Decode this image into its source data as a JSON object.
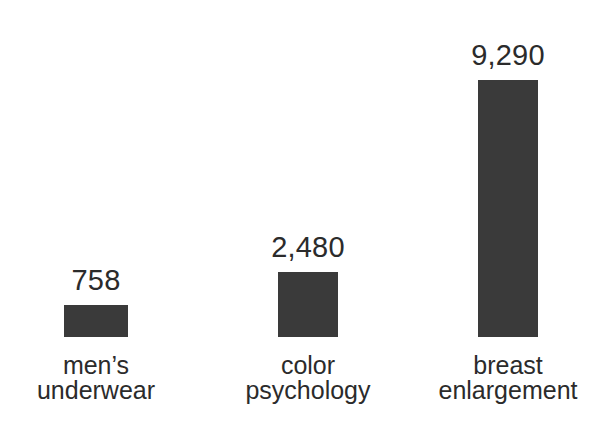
{
  "chart_data": {
    "type": "bar",
    "title": "",
    "subtitle": "",
    "xlabel": "",
    "ylabel": "",
    "grid": false,
    "legend": false,
    "legend_position": "none",
    "orientation": "vertical",
    "background_color": "#ffffff",
    "bar_color": "#3a3a3a",
    "text_color": "#2b2b2b",
    "baseline_visible": false,
    "axis_visible": false,
    "ylim": [
      0,
      9290
    ],
    "categories": [
      "men’s underwear",
      "color psychology",
      "breast enlargement"
    ],
    "category_lines": [
      [
        "men’s",
        "underwear"
      ],
      [
        "color",
        "psychology"
      ],
      [
        "breast",
        "enlargement"
      ]
    ],
    "values": [
      758,
      2480,
      9290
    ],
    "value_labels": [
      "758",
      "2,480",
      "9,290"
    ],
    "bars": [
      {
        "category": "men’s underwear",
        "line1": "men’s",
        "line2": "underwear",
        "value": 758,
        "value_label": "758",
        "left_px": 64,
        "width_px": 64,
        "height_px": 32,
        "center_px": 96
      },
      {
        "category": "color psychology",
        "line1": "color",
        "line2": "psychology",
        "value": 2480,
        "value_label": "2,480",
        "left_px": 278,
        "width_px": 60,
        "height_px": 65,
        "center_px": 308
      },
      {
        "category": "breast enlargement",
        "line1": "breast",
        "line2": "enlargement",
        "value": 9290,
        "value_label": "9,290",
        "left_px": 478,
        "width_px": 60,
        "height_px": 257,
        "center_px": 508
      }
    ]
  },
  "layout": {
    "baseline_y_px": 337,
    "value_label_gap_px": 10,
    "category_label_top_px": 353
  }
}
